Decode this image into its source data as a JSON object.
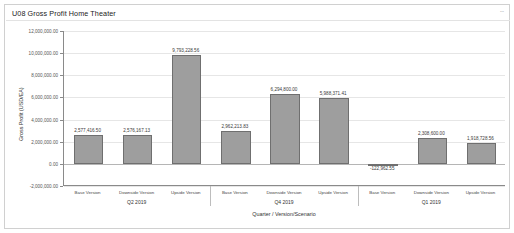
{
  "card": {
    "title": "U08 Gross Profit Home Theater",
    "menu_label": "⋯"
  },
  "chart_data": {
    "type": "bar",
    "title": "U08 Gross Profit Home Theater",
    "xlabel": "Quarter / Version/Scenario",
    "ylabel": "Gross Profit (USD/EA)",
    "categories": [
      "Base Version",
      "Downside Version",
      "Upside Version",
      "Base Version",
      "Downside Version",
      "Upside Version",
      "Base Version",
      "Downside Version",
      "Upside Version"
    ],
    "values": [
      2577416.5,
      2576167.13,
      9793228.56,
      2962213.83,
      6294800.0,
      5988371.41,
      -122962.55,
      2308600.0,
      1918728.56
    ],
    "value_labels": [
      "2,577,416.50",
      "2,576,167.13",
      "9,793,228.56",
      "2,962,213.83",
      "6,294,800.00",
      "5,988,371.41",
      "-122,962.55",
      "2,308,600.00",
      "1,918,728.56"
    ],
    "groups": [
      {
        "label": "Q2 2019",
        "count": 3
      },
      {
        "label": "Q4 2019",
        "count": 3
      },
      {
        "label": "Q1 2019",
        "count": 3
      }
    ],
    "ylim": [
      -2000000,
      12000000
    ],
    "yticks": [
      12000000,
      10000000,
      8000000,
      6000000,
      4000000,
      2000000,
      0,
      -2000000
    ],
    "ytick_labels": [
      "12,000,000.00",
      "10,000,000.00",
      "8,000,000.00",
      "6,000,000.00",
      "4,000,000.00",
      "2,000,000.00",
      "0.00",
      "-2,000,000.00"
    ],
    "grid": true,
    "legend": "none",
    "bar_color": "#9e9e9e",
    "bar_border_color": "#6f6f6f"
  }
}
